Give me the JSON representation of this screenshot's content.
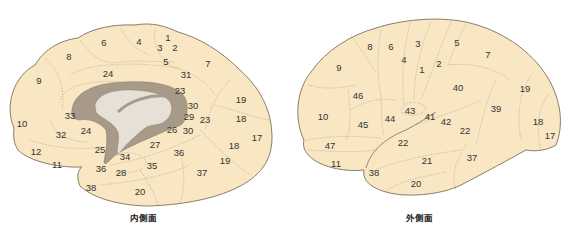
{
  "colors": {
    "cortex_fill": "#f8e7c2",
    "outline": "#8a7d6a",
    "corpus_callosum": "#a89a88",
    "ventricle": "#e6e0d6",
    "region_lines": "#b4a68e"
  },
  "medial": {
    "caption": "内側面",
    "labels": [
      {
        "t": "1",
        "x": 168,
        "y": 38
      },
      {
        "t": "2",
        "x": 175,
        "y": 48
      },
      {
        "t": "3",
        "x": 160,
        "y": 48
      },
      {
        "t": "4",
        "x": 139,
        "y": 42
      },
      {
        "t": "5",
        "x": 166,
        "y": 62
      },
      {
        "t": "6",
        "x": 104,
        "y": 43
      },
      {
        "t": "7",
        "x": 208,
        "y": 64
      },
      {
        "t": "8",
        "x": 69,
        "y": 57
      },
      {
        "t": "9",
        "x": 39,
        "y": 81
      },
      {
        "t": "24",
        "x": 108,
        "y": 74
      },
      {
        "t": "31",
        "x": 186,
        "y": 75
      },
      {
        "t": "23",
        "x": 180,
        "y": 91
      },
      {
        "t": "19",
        "x": 241,
        "y": 100
      },
      {
        "t": "30",
        "x": 193,
        "y": 106
      },
      {
        "t": "33",
        "x": 70,
        "y": 116
      },
      {
        "t": "29",
        "x": 189,
        "y": 117
      },
      {
        "t": "23",
        "x": 205,
        "y": 120
      },
      {
        "t": "18",
        "x": 241,
        "y": 119
      },
      {
        "t": "10",
        "x": 22,
        "y": 124
      },
      {
        "t": "24",
        "x": 86,
        "y": 131
      },
      {
        "t": "26",
        "x": 172,
        "y": 130
      },
      {
        "t": "30",
        "x": 188,
        "y": 131
      },
      {
        "t": "32",
        "x": 61,
        "y": 135
      },
      {
        "t": "17",
        "x": 257,
        "y": 138
      },
      {
        "t": "27",
        "x": 155,
        "y": 145
      },
      {
        "t": "18",
        "x": 234,
        "y": 146
      },
      {
        "t": "25",
        "x": 100,
        "y": 150
      },
      {
        "t": "12",
        "x": 36,
        "y": 152
      },
      {
        "t": "36",
        "x": 179,
        "y": 153
      },
      {
        "t": "34",
        "x": 125,
        "y": 157
      },
      {
        "t": "19",
        "x": 225,
        "y": 161
      },
      {
        "t": "11",
        "x": 57,
        "y": 165
      },
      {
        "t": "36",
        "x": 101,
        "y": 169
      },
      {
        "t": "35",
        "x": 152,
        "y": 166
      },
      {
        "t": "28",
        "x": 121,
        "y": 173
      },
      {
        "t": "37",
        "x": 202,
        "y": 173
      },
      {
        "t": "38",
        "x": 91,
        "y": 188
      },
      {
        "t": "20",
        "x": 140,
        "y": 192
      }
    ]
  },
  "lateral": {
    "caption": "外側面",
    "labels": [
      {
        "t": "8",
        "x": 84,
        "y": 47
      },
      {
        "t": "6",
        "x": 105,
        "y": 47
      },
      {
        "t": "3",
        "x": 132,
        "y": 44
      },
      {
        "t": "5",
        "x": 171,
        "y": 43
      },
      {
        "t": "4",
        "x": 118,
        "y": 60
      },
      {
        "t": "1",
        "x": 136,
        "y": 70
      },
      {
        "t": "2",
        "x": 153,
        "y": 64
      },
      {
        "t": "7",
        "x": 202,
        "y": 55
      },
      {
        "t": "9",
        "x": 53,
        "y": 68
      },
      {
        "t": "40",
        "x": 172,
        "y": 88
      },
      {
        "t": "19",
        "x": 239,
        "y": 89
      },
      {
        "t": "46",
        "x": 72,
        "y": 96
      },
      {
        "t": "43",
        "x": 124,
        "y": 111
      },
      {
        "t": "39",
        "x": 210,
        "y": 109
      },
      {
        "t": "10",
        "x": 37,
        "y": 117
      },
      {
        "t": "41",
        "x": 144,
        "y": 117
      },
      {
        "t": "44",
        "x": 104,
        "y": 119
      },
      {
        "t": "45",
        "x": 77,
        "y": 125
      },
      {
        "t": "42",
        "x": 160,
        "y": 122
      },
      {
        "t": "18",
        "x": 252,
        "y": 122
      },
      {
        "t": "22",
        "x": 179,
        "y": 131
      },
      {
        "t": "17",
        "x": 264,
        "y": 136
      },
      {
        "t": "22",
        "x": 117,
        "y": 143
      },
      {
        "t": "47",
        "x": 44,
        "y": 146
      },
      {
        "t": "21",
        "x": 141,
        "y": 161
      },
      {
        "t": "37",
        "x": 186,
        "y": 158
      },
      {
        "t": "11",
        "x": 50,
        "y": 164
      },
      {
        "t": "38",
        "x": 88,
        "y": 173
      },
      {
        "t": "20",
        "x": 130,
        "y": 184
      }
    ]
  }
}
